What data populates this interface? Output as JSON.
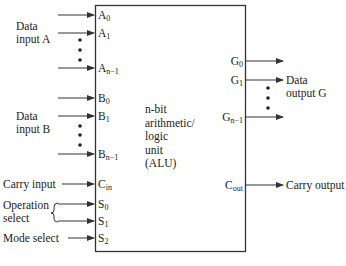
{
  "alu": {
    "center_lines": [
      "n-bit",
      "arithmetic/",
      "logic",
      "unit",
      "(ALU)"
    ]
  },
  "inputs": {
    "data_a_label": [
      "Data",
      "input A"
    ],
    "data_b_label": [
      "Data",
      "input B"
    ],
    "carry_input_label": "Carry input",
    "operation_select_label": [
      "Operation",
      "select"
    ],
    "mode_select_label": "Mode select"
  },
  "pins": {
    "a0": {
      "base": "A",
      "sub": "0"
    },
    "a1": {
      "base": "A",
      "sub": "1"
    },
    "an1": {
      "base": "A",
      "sub": "n−1"
    },
    "b0": {
      "base": "B",
      "sub": "0"
    },
    "b1": {
      "base": "B",
      "sub": "1"
    },
    "bn1": {
      "base": "B",
      "sub": "n−1"
    },
    "cin": {
      "base": "C",
      "sub": "in"
    },
    "s0": {
      "base": "S",
      "sub": "0"
    },
    "s1": {
      "base": "S",
      "sub": "1"
    },
    "s2": {
      "base": "S",
      "sub": "2"
    },
    "g0": {
      "base": "G",
      "sub": "0"
    },
    "g1": {
      "base": "G",
      "sub": "1"
    },
    "gn1": {
      "base": "G",
      "sub": "n−1"
    },
    "cout": {
      "base": "C",
      "sub": "out"
    }
  },
  "outputs": {
    "data_g_label": [
      "Data",
      "output G"
    ],
    "carry_output_label": "Carry output"
  },
  "icons": {
    "arrow": "right-arrowhead",
    "ellipsis": "vertical-dots",
    "brace": "left-curly-brace"
  },
  "colors": {
    "line": "#333333",
    "text": "#222222",
    "background": "#ffffff"
  }
}
